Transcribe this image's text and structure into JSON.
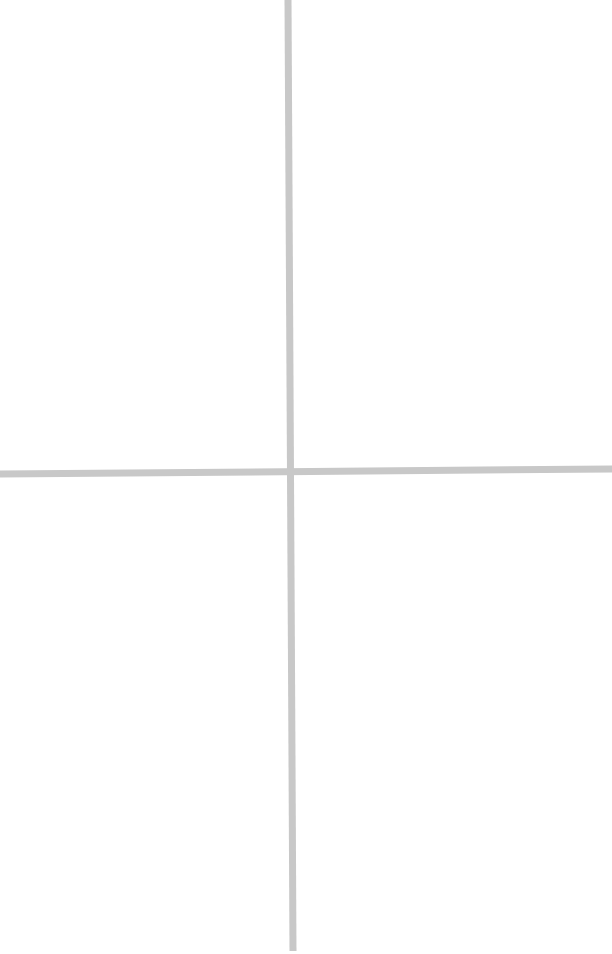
{
  "figure": {
    "line_color": "#c8c8c8",
    "background_color": "#ffffff"
  }
}
